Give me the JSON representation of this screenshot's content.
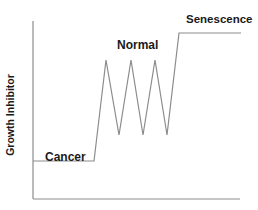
{
  "diagram": {
    "y_axis_label": "Growth Inhibitor",
    "x_axis_label": "",
    "regions": [
      {
        "id": "cancer",
        "label": "Cancer",
        "level": "low"
      },
      {
        "id": "normal",
        "label": "Normal",
        "level": "oscillating"
      },
      {
        "id": "senescence",
        "label": "Senescence",
        "level": "high"
      }
    ],
    "line_color": "#8c8c8c",
    "axis_color": "#8c8c8c",
    "text_color": "#1a1a1a",
    "trace_points": [
      [
        33,
        161
      ],
      [
        94,
        161
      ],
      [
        106,
        60
      ],
      [
        119,
        135
      ],
      [
        131,
        60
      ],
      [
        143,
        135
      ],
      [
        155,
        60
      ],
      [
        167,
        135
      ],
      [
        179,
        33
      ],
      [
        241,
        33
      ]
    ],
    "axes": {
      "origin": [
        33,
        199
      ],
      "y_top": [
        33,
        21
      ],
      "x_right": [
        240,
        199
      ]
    }
  }
}
